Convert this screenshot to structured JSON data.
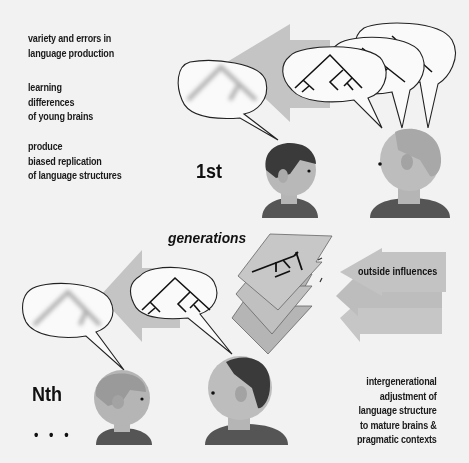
{
  "left_notes": [
    {
      "lines": [
        "variety and errors in",
        "language production"
      ]
    },
    {
      "lines": [
        "learning",
        "differences",
        "of young brains"
      ]
    },
    {
      "lines": [
        "produce",
        "biased replication",
        "of language structures"
      ]
    }
  ],
  "labels": {
    "first_generation": "1st",
    "nth_generation": "Nth",
    "ellipsis": "• • •",
    "generations": "generations",
    "outside_influences": "outside influences"
  },
  "right_note": {
    "lines": [
      "intergenerational",
      "adjustment of",
      "language structure",
      "to mature brains &",
      "pragmatic contexts"
    ]
  },
  "colors": {
    "background": "#f2f2f2",
    "arrow_gray": "#c4c4c4",
    "face_gray": "#b5b5b5",
    "dark_hair": "#3a3a3a",
    "shirt": "#555555",
    "text": "#1a1a1a"
  }
}
